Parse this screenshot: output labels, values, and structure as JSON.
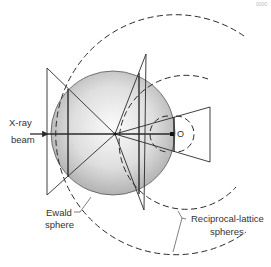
{
  "labels": {
    "xray_line1": "X-ray",
    "xray_line2": "beam",
    "origin": "O",
    "ewald_line1": "Ewald",
    "ewald_line2": "sphere",
    "recip_line1": "Reciprocal-lattice",
    "recip_line2": "spheres",
    "corner": "0000"
  },
  "colors": {
    "line": "#2a2a2a",
    "sphere_light": "#f4f4f4",
    "sphere_dark": "#a9a9a9",
    "text": "#333333"
  }
}
